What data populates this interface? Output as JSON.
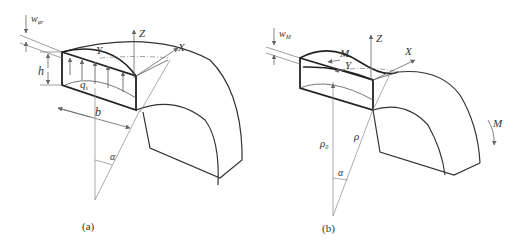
{
  "figure": {
    "panel_a": {
      "caption": "(a)",
      "labels": {
        "w": "w",
        "w_sub": "φr",
        "h": "h",
        "q": "q",
        "q_sub": "s",
        "b": "b",
        "Y": "Y",
        "Z": "Z",
        "X": "X",
        "alpha": "α"
      }
    },
    "panel_b": {
      "caption": "(b)",
      "labels": {
        "w": "w",
        "w_sub": "M",
        "M_top": "M",
        "Y": "Y",
        "Z": "Z",
        "X": "X",
        "M_right": "M",
        "rho0": "ρ",
        "rho0_sub": "0",
        "rho": "ρ",
        "alpha": "α"
      }
    }
  }
}
